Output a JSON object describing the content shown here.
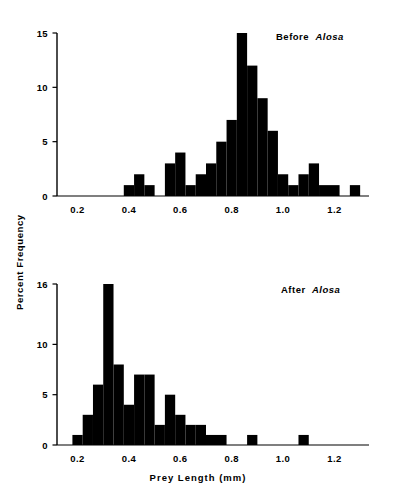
{
  "figure": {
    "y_axis_title": "Percent Frequency",
    "x_axis_title": "Prey Length (mm)"
  },
  "chart_data": [
    {
      "type": "bar",
      "id": "before-alosa",
      "title": "Before Alosa",
      "title_plain": "Before",
      "title_italic": "Alosa",
      "xlabel": "Prey Length (mm)",
      "ylabel": "Percent Frequency",
      "xlim": [
        0.12,
        1.28
      ],
      "ylim": [
        0,
        15
      ],
      "grid": false,
      "legend": false,
      "bin_width": 0.04,
      "xticks": [
        0.2,
        0.4,
        0.6,
        0.8,
        1.0,
        1.2
      ],
      "xtick_labels": [
        "0.2",
        "0.4",
        "0.6",
        "0.8",
        "1.0",
        "1.2"
      ],
      "yticks": [
        0,
        5,
        10,
        15
      ],
      "ytick_labels": [
        "0",
        "5",
        "10",
        "15"
      ],
      "bin_starts": [
        0.38,
        0.42,
        0.46,
        0.54,
        0.58,
        0.62,
        0.66,
        0.7,
        0.74,
        0.78,
        0.82,
        0.86,
        0.9,
        0.94,
        0.98,
        1.02,
        1.06,
        1.18
      ],
      "values": [
        1,
        2,
        1,
        3,
        4,
        1,
        2,
        3,
        5,
        7,
        15,
        12,
        9,
        6,
        2,
        1,
        2,
        3,
        1,
        1
      ],
      "bars": [
        {
          "x0": 0.38,
          "x1": 0.42,
          "y": 1
        },
        {
          "x0": 0.42,
          "x1": 0.46,
          "y": 2
        },
        {
          "x0": 0.46,
          "x1": 0.5,
          "y": 1
        },
        {
          "x0": 0.54,
          "x1": 0.58,
          "y": 3
        },
        {
          "x0": 0.58,
          "x1": 0.62,
          "y": 4
        },
        {
          "x0": 0.62,
          "x1": 0.66,
          "y": 1
        },
        {
          "x0": 0.66,
          "x1": 0.7,
          "y": 2
        },
        {
          "x0": 0.7,
          "x1": 0.74,
          "y": 3
        },
        {
          "x0": 0.74,
          "x1": 0.78,
          "y": 5
        },
        {
          "x0": 0.78,
          "x1": 0.82,
          "y": 7
        },
        {
          "x0": 0.82,
          "x1": 0.86,
          "y": 15
        },
        {
          "x0": 0.86,
          "x1": 0.9,
          "y": 12
        },
        {
          "x0": 0.9,
          "x1": 0.94,
          "y": 9
        },
        {
          "x0": 0.94,
          "x1": 0.98,
          "y": 6
        },
        {
          "x0": 0.98,
          "x1": 1.02,
          "y": 2
        },
        {
          "x0": 1.02,
          "x1": 1.06,
          "y": 1
        },
        {
          "x0": 1.06,
          "x1": 1.1,
          "y": 2
        },
        {
          "x0": 1.1,
          "x1": 1.14,
          "y": 3
        },
        {
          "x0": 1.14,
          "x1": 1.22,
          "y": 1
        },
        {
          "x0": 1.26,
          "x1": 1.3,
          "y": 1
        }
      ]
    },
    {
      "type": "bar",
      "id": "after-alosa",
      "title": "After Alosa",
      "title_plain": "After",
      "title_italic": "Alosa",
      "xlabel": "Prey Length (mm)",
      "ylabel": "Percent Frequency",
      "xlim": [
        0.12,
        1.28
      ],
      "ylim": [
        0,
        16
      ],
      "grid": false,
      "legend": false,
      "bin_width": 0.04,
      "xticks": [
        0.2,
        0.4,
        0.6,
        0.8,
        1.0,
        1.2
      ],
      "xtick_labels": [
        "0.2",
        "0.4",
        "0.6",
        "0.8",
        "1.0",
        "1.2"
      ],
      "yticks": [
        0,
        5,
        10,
        16
      ],
      "ytick_labels": [
        "0",
        "5",
        "10",
        "16"
      ],
      "bars": [
        {
          "x0": 0.18,
          "x1": 0.22,
          "y": 1
        },
        {
          "x0": 0.22,
          "x1": 0.26,
          "y": 3
        },
        {
          "x0": 0.26,
          "x1": 0.3,
          "y": 6
        },
        {
          "x0": 0.3,
          "x1": 0.34,
          "y": 16
        },
        {
          "x0": 0.34,
          "x1": 0.38,
          "y": 8
        },
        {
          "x0": 0.38,
          "x1": 0.42,
          "y": 4
        },
        {
          "x0": 0.42,
          "x1": 0.46,
          "y": 7
        },
        {
          "x0": 0.46,
          "x1": 0.5,
          "y": 7
        },
        {
          "x0": 0.5,
          "x1": 0.54,
          "y": 2
        },
        {
          "x0": 0.54,
          "x1": 0.58,
          "y": 5
        },
        {
          "x0": 0.58,
          "x1": 0.62,
          "y": 3
        },
        {
          "x0": 0.62,
          "x1": 0.66,
          "y": 2
        },
        {
          "x0": 0.66,
          "x1": 0.7,
          "y": 2
        },
        {
          "x0": 0.7,
          "x1": 0.78,
          "y": 1
        },
        {
          "x0": 0.86,
          "x1": 0.9,
          "y": 1
        },
        {
          "x0": 1.06,
          "x1": 1.1,
          "y": 1
        }
      ]
    }
  ],
  "colors": {
    "bar": "#000000",
    "axis": "#000000",
    "background": "#ffffff"
  }
}
